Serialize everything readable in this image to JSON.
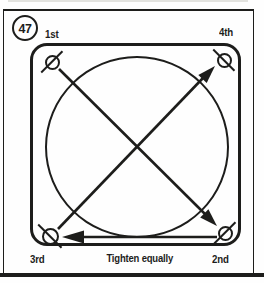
{
  "figure": {
    "number": "47",
    "caption": "Tighten equally"
  },
  "sequence_labels": {
    "top_left": "1st",
    "top_right": "4th",
    "bottom_left": "3rd",
    "bottom_right": "2nd"
  },
  "diagram": {
    "type": "bolt-tightening-sequence",
    "bolt_icon": "circle-with-slash",
    "arrows": [
      {
        "from": "1st",
        "to": "2nd",
        "direction": "diagonal down-right"
      },
      {
        "from": "2nd",
        "to": "3rd",
        "direction": "horizontal left"
      },
      {
        "from": "3rd",
        "to": "4th",
        "direction": "diagonal up-right"
      }
    ]
  },
  "colors": {
    "ink": "#1d1d1b",
    "paper": "#fefefe"
  }
}
